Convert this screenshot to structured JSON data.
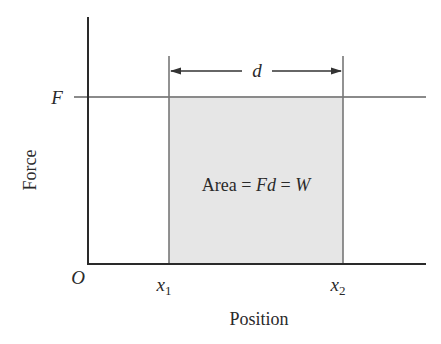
{
  "diagram": {
    "title": "",
    "y_axis_label": "Force",
    "x_axis_label": "Position",
    "origin_label": "O",
    "force_label": "F",
    "x1_label": "x",
    "x1_sub": "1",
    "x2_label": "x",
    "x2_sub": "2",
    "distance_label": "d",
    "area_label": {
      "prefix": "Area = ",
      "fd": "Fd",
      "eq": " = ",
      "w": "W"
    },
    "colors": {
      "axis": "#2a2a2a",
      "force_line": "#8a8a8a",
      "shaded_area": "#e6e6e6",
      "boundary_lines": "#777777"
    }
  }
}
